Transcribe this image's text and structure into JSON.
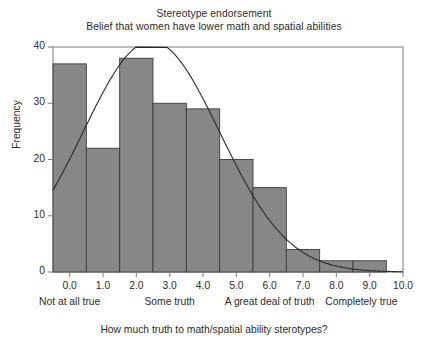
{
  "chart_data": {
    "type": "bar",
    "title": "Stereotype endorsement",
    "subtitle": "Belief that women have lower math and spatial abilities",
    "xlabel": "How much truth to math/spatial ability sterotypes?",
    "ylabel": "Frequency",
    "xlim": [
      -0.5,
      10.0
    ],
    "ylim": [
      0,
      40
    ],
    "yticks": [
      "0",
      "10",
      "20",
      "30",
      "40"
    ],
    "ytick_values": [
      0,
      10,
      20,
      30,
      40
    ],
    "xticks": [
      "0.0",
      "1.0",
      "2.0",
      "3.0",
      "4.0",
      "5.0",
      "6.0",
      "7.0",
      "8.0",
      "9.0",
      "10.0"
    ],
    "xtick_values": [
      0,
      1,
      2,
      3,
      4,
      5,
      6,
      7,
      8,
      9,
      10
    ],
    "grid": false,
    "legend": "none",
    "bin_width": 1.0,
    "bar_centers": [
      0.0,
      1.0,
      2.0,
      3.0,
      4.0,
      5.0,
      6.0,
      7.0,
      8.0,
      9.0
    ],
    "categories": [
      "0.0",
      "1.0",
      "2.0",
      "3.0",
      "4.0",
      "5.0",
      "6.0",
      "7.0",
      "8.0",
      "9.0"
    ],
    "values": [
      37,
      22,
      38,
      30,
      29,
      20,
      15,
      4,
      2,
      2
    ],
    "bar_labels": [
      "37",
      "22",
      "38",
      "30",
      "29",
      "20",
      "15",
      "4",
      "",
      ""
    ],
    "bar_color": "#878787",
    "bar_edge_color": "#3c3c3c",
    "overlay": {
      "type": "line",
      "name": "normal curve",
      "mean": 2.45,
      "peak_value": 41.0,
      "std": 2.05,
      "start_value_at_x_min": 13.5,
      "color": "#2a2a2a"
    },
    "category_labels": [
      {
        "text": "Not at all true",
        "at_x": 0.0
      },
      {
        "text": "Some truth",
        "at_x": 3.0
      },
      {
        "text": "A great deal of truth",
        "at_x": 6.0
      },
      {
        "text": "Completely true",
        "at_x": 8.75
      }
    ]
  },
  "colors": {
    "bar_fill": "#878787",
    "bar_edge": "#3c3c3c",
    "axis": "#7a7a7a",
    "curve": "#2a2a2a",
    "text": "#2b2b2b"
  }
}
